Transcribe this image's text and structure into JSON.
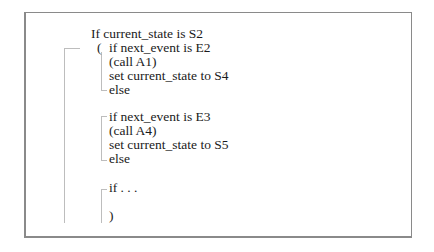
{
  "diagram": {
    "type": "pseudocode-state-machine",
    "lines": [
      {
        "text": "If current_state is S2"
      },
      {
        "text": "("
      },
      {
        "text": "if next_event is E2"
      },
      {
        "text": "(call A1)"
      },
      {
        "text": "set current_state to S4"
      },
      {
        "text": "else"
      },
      {
        "text": "if next_event is E3"
      },
      {
        "text": "(call A4)"
      },
      {
        "text": "set current_state to S5"
      },
      {
        "text": "else"
      },
      {
        "text": "if . . ."
      },
      {
        "text": ")"
      }
    ]
  }
}
